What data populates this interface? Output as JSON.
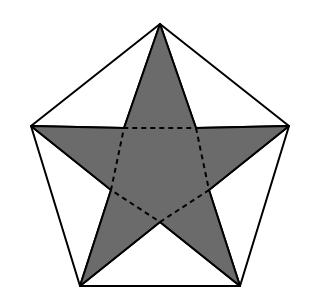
{
  "canvas": {
    "width": 314,
    "height": 306,
    "background_color": "#ffffff"
  },
  "figure": {
    "name": "pentagram-in-pentagon",
    "stroke_color": "#000000",
    "stroke_width": 2,
    "dash_stroke_color": "#000000",
    "dash_stroke_width": 2,
    "dash_pattern": "5,4",
    "star_fill": "#6b6b6b",
    "corner_fill": "#333333",
    "center": {
      "x": 160,
      "y": 160
    },
    "outer_radius": 136,
    "inner_radius": 52
  },
  "geometry": {
    "pentagon_vertices": [
      {
        "name": "top",
        "x": 160,
        "y": 24
      },
      {
        "name": "right",
        "x": 289,
        "y": 126
      },
      {
        "name": "bottom-right",
        "x": 240,
        "y": 286
      },
      {
        "name": "bottom-left",
        "x": 80,
        "y": 286
      },
      {
        "name": "left",
        "x": 31,
        "y": 126
      }
    ],
    "inner_pentagon_vertices": [
      {
        "name": "inner-top-right",
        "x": 196,
        "y": 128
      },
      {
        "name": "inner-right",
        "x": 209,
        "y": 190
      },
      {
        "name": "inner-bottom",
        "x": 160,
        "y": 222
      },
      {
        "name": "inner-left",
        "x": 111,
        "y": 190
      },
      {
        "name": "inner-top-left",
        "x": 124,
        "y": 128
      }
    ],
    "star_points": 5,
    "corner_triangle_count": 5
  },
  "legend": {
    "star_region_label": "star",
    "corner_region_label": "corner triangle",
    "inner_region_label": "inner pentagon"
  }
}
